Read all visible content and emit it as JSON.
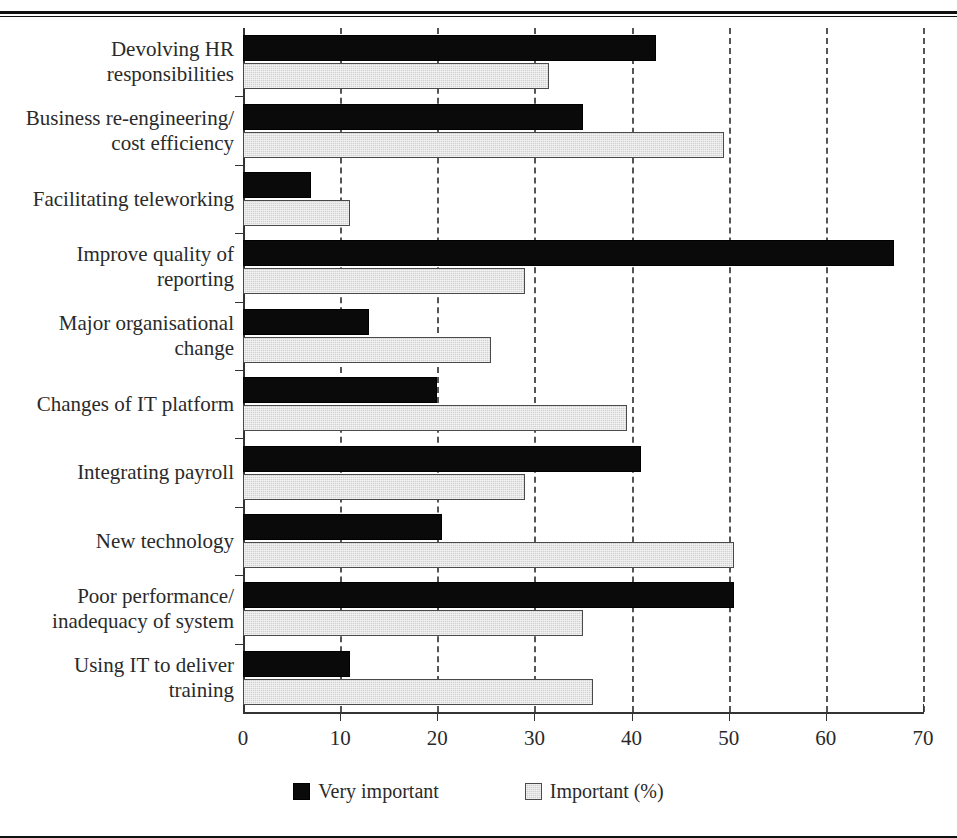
{
  "figure": {
    "background": "#ffffff",
    "series_colors": {
      "very_important": "#0a0a0a",
      "important": "#d2d2d2"
    },
    "axis_color": "#333333",
    "grid_color": "#555555"
  },
  "legend": {
    "position": "bottom-center",
    "entries": [
      {
        "label": "Very important",
        "swatch": "dark"
      },
      {
        "label": "Important (%)",
        "swatch": "light"
      }
    ]
  },
  "chart_data": {
    "type": "bar",
    "orientation": "horizontal",
    "title": "",
    "xlabel": "",
    "ylabel": "",
    "xlim": [
      0,
      70
    ],
    "xticks": [
      0,
      10,
      20,
      30,
      40,
      50,
      60,
      70
    ],
    "xticklabels": [
      "0",
      "10",
      "20",
      "30",
      "40",
      "50",
      "60",
      "70"
    ],
    "grid": "x-dashed",
    "legend_position": "bottom-center",
    "categories": [
      "Devolving HR responsibilities",
      "Business re-engineering/ cost efficiency",
      "Facilitating teleworking",
      "Improve quality of reporting",
      "Major organisational change",
      "Changes of IT platform",
      "Integrating payroll",
      "New technology",
      "Poor performance/ inadequacy of system",
      "Using IT to deliver training"
    ],
    "category_lines": [
      [
        "Devolving HR",
        "responsibilities"
      ],
      [
        "Business re-engineering/",
        "cost efficiency"
      ],
      [
        "Facilitating teleworking"
      ],
      [
        "Improve quality of",
        "reporting"
      ],
      [
        "Major organisational",
        "change"
      ],
      [
        "Changes of IT platform"
      ],
      [
        "Integrating payroll"
      ],
      [
        "New technology"
      ],
      [
        "Poor performance/",
        "inadequacy of system"
      ],
      [
        "Using IT to deliver",
        "training"
      ]
    ],
    "series": [
      {
        "name": "Very important",
        "color": "#0a0a0a",
        "values": [
          42.5,
          35,
          7,
          67,
          13,
          20,
          41,
          20.5,
          50.5,
          11
        ]
      },
      {
        "name": "Important (%)",
        "color": "#d2d2d2",
        "values": [
          31.5,
          49.5,
          11,
          29,
          25.5,
          39.5,
          29,
          50.5,
          35,
          36
        ]
      }
    ]
  }
}
